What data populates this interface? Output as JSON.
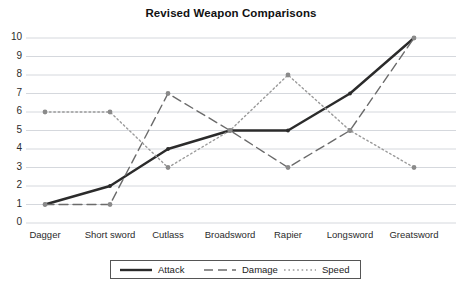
{
  "chart_data": {
    "type": "line",
    "title": "Revised Weapon Comparisons",
    "xlabel": "",
    "ylabel": "",
    "ylim": [
      0,
      10
    ],
    "ytick_labels": [
      "0",
      "1",
      "2",
      "3",
      "4",
      "5",
      "6",
      "7",
      "8",
      "9",
      "10"
    ],
    "grid": true,
    "legend_position": "bottom",
    "categories": [
      "Dagger",
      "Short sword",
      "Cutlass",
      "Broadsword",
      "Rapier",
      "Longsword",
      "Greatsword"
    ],
    "series": [
      {
        "name": "Attack",
        "style": "solid",
        "values": [
          1,
          2,
          4,
          5,
          5,
          7,
          10
        ]
      },
      {
        "name": "Damage",
        "style": "dashed",
        "values": [
          1,
          1,
          7,
          5,
          3,
          5,
          10
        ]
      },
      {
        "name": "Speed",
        "style": "dotted",
        "values": [
          6,
          6,
          3,
          5,
          8,
          5,
          3
        ]
      }
    ]
  },
  "colors": {
    "attack_line": "#2b2b2b",
    "damage_line": "#6b6b6b",
    "speed_line": "#9a9a9a",
    "marker": "#8a8a8a",
    "gridline": "#d5d8dd",
    "legend_border": "#555555",
    "background": "#ffffff",
    "text": "#1a1a1a"
  },
  "legend": {
    "items": [
      {
        "label": "Attack",
        "icon": "solid-line-swatch"
      },
      {
        "label": "Damage",
        "icon": "dashed-line-swatch"
      },
      {
        "label": "Speed",
        "icon": "dotted-line-swatch"
      }
    ]
  }
}
